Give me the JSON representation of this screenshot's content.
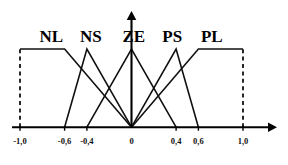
{
  "chart_data": {
    "type": "line",
    "title": "",
    "subtitle": "",
    "xlabel": "",
    "ylabel": "",
    "xlim": [
      -1.0,
      1.0
    ],
    "ylim": [
      0,
      1
    ],
    "grid": false,
    "legend_position": "above-plot",
    "decimal_separator": ",",
    "x_ticks": [
      {
        "value": -1.0,
        "label": "-1,0"
      },
      {
        "value": -0.6,
        "label": "-0,6"
      },
      {
        "value": -0.4,
        "label": "-0,4"
      },
      {
        "value": 0.0,
        "label": "0"
      },
      {
        "value": 0.4,
        "label": "0,4"
      },
      {
        "value": 0.6,
        "label": "0,6"
      },
      {
        "value": 1.0,
        "label": "1,0"
      }
    ],
    "y_ticks": [],
    "boundary_lines": [
      {
        "x": -1.0,
        "style": "dashed",
        "from_y": 0,
        "to_y": 1
      },
      {
        "x": 1.0,
        "style": "dashed",
        "from_y": 0,
        "to_y": 1
      }
    ],
    "series": [
      {
        "name": "NL",
        "label": "NL",
        "shape": "trapezoid",
        "label_x": -0.72,
        "points": [
          {
            "x": -1.0,
            "y": 1
          },
          {
            "x": -0.6,
            "y": 1
          },
          {
            "x": 0.0,
            "y": 0
          }
        ]
      },
      {
        "name": "NS",
        "label": "NS",
        "shape": "triangle",
        "label_x": -0.365,
        "points": [
          {
            "x": -0.6,
            "y": 0
          },
          {
            "x": -0.4,
            "y": 1
          },
          {
            "x": 0.0,
            "y": 0
          }
        ]
      },
      {
        "name": "ZE",
        "label": "ZE",
        "shape": "triangle",
        "label_x": 0.02,
        "points": [
          {
            "x": -0.4,
            "y": 0
          },
          {
            "x": 0.0,
            "y": 1
          },
          {
            "x": 0.4,
            "y": 0
          }
        ]
      },
      {
        "name": "PS",
        "label": "PS",
        "shape": "triangle",
        "label_x": 0.365,
        "points": [
          {
            "x": 0.0,
            "y": 0
          },
          {
            "x": 0.4,
            "y": 1
          },
          {
            "x": 0.6,
            "y": 0
          }
        ]
      },
      {
        "name": "PL",
        "label": "PL",
        "shape": "trapezoid",
        "label_x": 0.72,
        "points": [
          {
            "x": 0.0,
            "y": 0
          },
          {
            "x": 0.6,
            "y": 1
          },
          {
            "x": 1.0,
            "y": 1
          }
        ]
      }
    ],
    "colors": {
      "curve": "#111111",
      "axis": "#000000",
      "text": "#000000",
      "background": "#ffffff"
    }
  }
}
